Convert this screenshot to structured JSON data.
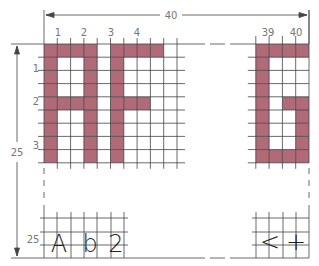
{
  "diagram": {
    "width_dimension": "40",
    "height_dimension": "25",
    "column_labels_left": [
      "1",
      "2",
      "3",
      "4"
    ],
    "column_labels_right": [
      "39",
      "40"
    ],
    "row_labels": [
      "1",
      "2",
      "3"
    ],
    "bottom_row_label": "25",
    "fill_color": "#b06a78",
    "line_color": "#333333",
    "left_block": {
      "text": "AF",
      "cols": 10,
      "rows": 9,
      "filled": [
        [
          0,
          0
        ],
        [
          0,
          1
        ],
        [
          0,
          2
        ],
        [
          0,
          3
        ],
        [
          0,
          5
        ],
        [
          0,
          6
        ],
        [
          0,
          7
        ],
        [
          0,
          8
        ],
        [
          1,
          0
        ],
        [
          1,
          3
        ],
        [
          1,
          5
        ],
        [
          2,
          0
        ],
        [
          2,
          3
        ],
        [
          2,
          5
        ],
        [
          3,
          0
        ],
        [
          3,
          3
        ],
        [
          3,
          5
        ],
        [
          4,
          0
        ],
        [
          4,
          1
        ],
        [
          4,
          2
        ],
        [
          4,
          3
        ],
        [
          4,
          5
        ],
        [
          4,
          6
        ],
        [
          4,
          7
        ],
        [
          5,
          0
        ],
        [
          5,
          3
        ],
        [
          5,
          5
        ],
        [
          6,
          0
        ],
        [
          6,
          3
        ],
        [
          6,
          5
        ],
        [
          7,
          0
        ],
        [
          7,
          3
        ],
        [
          7,
          5
        ],
        [
          8,
          0
        ],
        [
          8,
          3
        ],
        [
          8,
          5
        ]
      ]
    },
    "right_block": {
      "text": "G",
      "cols": 4,
      "rows": 9,
      "filled": [
        [
          0,
          0
        ],
        [
          0,
          1
        ],
        [
          0,
          2
        ],
        [
          0,
          3
        ],
        [
          1,
          0
        ],
        [
          2,
          0
        ],
        [
          3,
          0
        ],
        [
          4,
          0
        ],
        [
          4,
          2
        ],
        [
          4,
          3
        ],
        [
          5,
          0
        ],
        [
          5,
          3
        ],
        [
          6,
          0
        ],
        [
          6,
          3
        ],
        [
          7,
          0
        ],
        [
          7,
          3
        ],
        [
          8,
          0
        ],
        [
          8,
          1
        ],
        [
          8,
          2
        ],
        [
          8,
          3
        ]
      ]
    },
    "bottom_left_text": [
      "A",
      "b",
      "2"
    ],
    "bottom_right_text": [
      "<",
      "+"
    ]
  }
}
